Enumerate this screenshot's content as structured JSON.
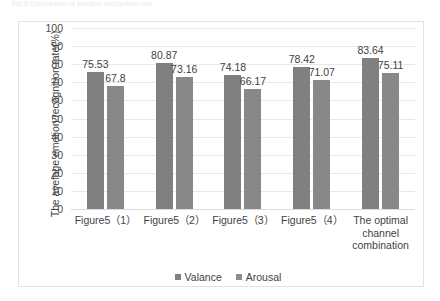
{
  "page": {
    "top_clipped_text": "Fig.6  Comparison of emotion recognition rate"
  },
  "chart_data": {
    "type": "bar",
    "title": "",
    "xlabel": "",
    "ylabel": "The avefage emotion recognition rate(%)",
    "ylim": [
      0,
      100
    ],
    "yticks": [
      100,
      90,
      80,
      70,
      60,
      50,
      40,
      30,
      20,
      10,
      0
    ],
    "grid": true,
    "legend_position": "bottom",
    "categories": [
      "Figure5（1）",
      "Figure5（2）",
      "Figure5（3）",
      "Figure5（4）",
      "The optimal channel combination"
    ],
    "series": [
      {
        "name": "Valance",
        "color": "#808080",
        "values": [
          75.53,
          80.87,
          74.18,
          78.42,
          83.64
        ],
        "labels": [
          "75.53",
          "80.87",
          "74.18",
          "78.42",
          "83.64"
        ]
      },
      {
        "name": "Arousal",
        "color": "#888888",
        "values": [
          67.8,
          73.16,
          66.17,
          71.07,
          75.11
        ],
        "labels": [
          "67.8",
          "73.16",
          "66.17",
          "71.07",
          "75.11"
        ]
      }
    ]
  }
}
